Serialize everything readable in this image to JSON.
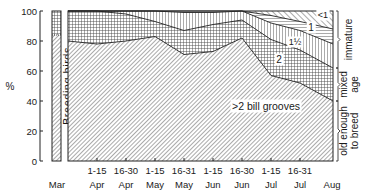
{
  "chart_data": {
    "type": "area",
    "title": "",
    "ylabel": "%",
    "xlabel": "",
    "ylim": [
      0,
      100
    ],
    "yticks": [
      0,
      20,
      40,
      60,
      80,
      100
    ],
    "grid": false,
    "breeding_bar": {
      "label": "Breeding birds",
      "old_enough_to_breed": 84,
      "mixed_age": 16
    },
    "x": [
      "Mar",
      "1-15 Apr",
      "16-30 Apr",
      "1-15 May",
      "16-31 May",
      "1-15 Jun",
      "16-30 Jun",
      "1-15 Jul",
      "16-31 Jul",
      "Aug"
    ],
    "x_tick_labels": [
      {
        "top": "",
        "bottom": "Mar"
      },
      {
        "top": "1-15",
        "bottom": "Apr"
      },
      {
        "top": "16-30",
        "bottom": "Apr"
      },
      {
        "top": "1-15",
        "bottom": "May"
      },
      {
        "top": "16-31",
        "bottom": "May"
      },
      {
        "top": "1-15",
        "bottom": "Jun"
      },
      {
        "top": "16-30",
        "bottom": "Jun"
      },
      {
        "top": "1-15",
        "bottom": "Jul"
      },
      {
        "top": "16-31",
        "bottom": "Jul"
      },
      {
        "top": "",
        "bottom": "Aug"
      }
    ],
    "series_cumulative_top": [
      {
        "name": ">2 bill grooves",
        "group": "old enough to breed",
        "values": [
          80,
          78,
          80,
          83,
          71,
          73,
          82,
          57,
          52,
          40
        ]
      },
      {
        "name": "2",
        "group": "mixed age",
        "values": [
          100,
          100,
          98,
          93,
          87,
          91,
          94,
          81,
          74,
          62
        ]
      },
      {
        "name": "1½",
        "group": "immature",
        "values": [
          100,
          100,
          100,
          100,
          99,
          99,
          100,
          92,
          87,
          78
        ]
      },
      {
        "name": "1",
        "group": "immature",
        "values": [
          100,
          100,
          100,
          100,
          100,
          100,
          100,
          97,
          93,
          88
        ]
      },
      {
        "name": "<1",
        "group": "immature",
        "values": [
          100,
          100,
          100,
          100,
          100,
          100,
          100,
          100,
          100,
          100
        ]
      }
    ],
    "series": [
      {
        "name": ">2 bill grooves",
        "values": [
          80,
          78,
          80,
          83,
          71,
          73,
          82,
          57,
          52,
          40
        ]
      },
      {
        "name": "2",
        "values": [
          20,
          22,
          18,
          10,
          16,
          18,
          12,
          24,
          22,
          22
        ]
      },
      {
        "name": "1½",
        "values": [
          0,
          0,
          2,
          7,
          12,
          8,
          6,
          11,
          13,
          16
        ]
      },
      {
        "name": "1",
        "values": [
          0,
          0,
          0,
          0,
          1,
          1,
          0,
          5,
          6,
          10
        ]
      },
      {
        "name": "<1",
        "values": [
          0,
          0,
          0,
          0,
          0,
          0,
          0,
          3,
          7,
          12
        ]
      }
    ],
    "annotations": [
      {
        "text": ">2 bill grooves"
      },
      {
        "text": "2"
      },
      {
        "text": "1½"
      },
      {
        "text": "1"
      },
      {
        "text": "<1"
      }
    ],
    "right_brackets": [
      {
        "label": "immature"
      },
      {
        "label_lines": [
          "mixed",
          "age"
        ]
      },
      {
        "label_lines": [
          "old enough",
          "to breed"
        ]
      }
    ]
  }
}
